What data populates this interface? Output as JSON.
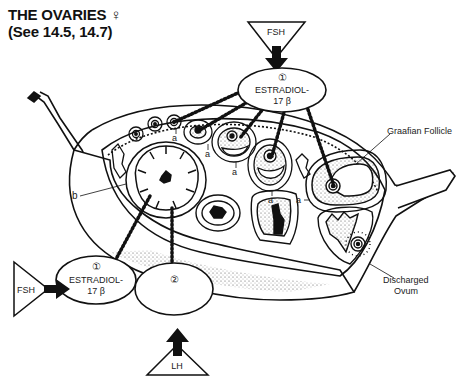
{
  "title": {
    "line1": "THE OVARIES ♀",
    "line2": "(See 14.5, 14.7)"
  },
  "hormones": {
    "fsh_top": "FSH",
    "fsh_left": "FSH",
    "lh": "LH"
  },
  "ovals": {
    "top": {
      "number": "①",
      "line1": "ESTRADIOL-",
      "line2": "17 β"
    },
    "left": {
      "number": "①",
      "line1": "ESTRADIOL-",
      "line2": "17 β"
    },
    "right": {
      "number": "②"
    }
  },
  "labels": {
    "graafian": "Graafian Follicle",
    "discharged_line1": "Discharged",
    "discharged_line2": "Ovum",
    "a": "a",
    "b": "b"
  }
}
